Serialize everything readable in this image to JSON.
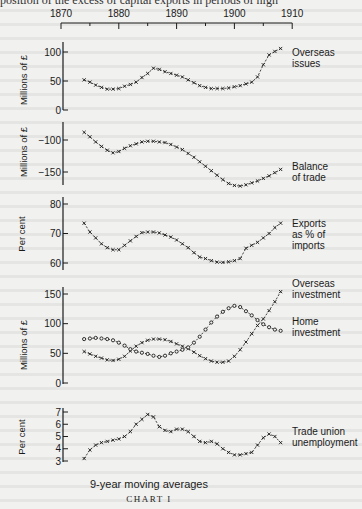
{
  "page": {
    "top_text_fragment": "position of the excess of capital exports in periods of high",
    "subtitle": "9-year moving averages",
    "chart_title": "CHART I"
  },
  "x_axis": {
    "ticks": [
      1870,
      1880,
      1890,
      1900,
      1910
    ],
    "minor_tick_step": 5,
    "position": "top"
  },
  "chart_data": [
    {
      "type": "line",
      "title": "Overseas issues",
      "ylabel": "Millions of £",
      "yticks": [
        0,
        50,
        100
      ],
      "ylim": [
        0,
        100
      ],
      "marker": "x",
      "x": [
        1874,
        1875,
        1876,
        1877,
        1878,
        1879,
        1880,
        1881,
        1882,
        1883,
        1884,
        1885,
        1886,
        1887,
        1888,
        1889,
        1890,
        1891,
        1892,
        1893,
        1894,
        1895,
        1896,
        1897,
        1898,
        1899,
        1900,
        1901,
        1902,
        1903,
        1904,
        1905,
        1906,
        1907,
        1908
      ],
      "series": [
        {
          "name": "Overseas issues",
          "values": [
            52,
            48,
            43,
            39,
            36,
            36,
            37,
            41,
            44,
            48,
            56,
            63,
            72,
            70,
            66,
            63,
            60,
            57,
            52,
            47,
            42,
            39,
            37,
            37,
            37,
            38,
            40,
            42,
            45,
            48,
            57,
            78,
            95,
            101,
            106
          ]
        }
      ]
    },
    {
      "type": "line",
      "title": "Balance of trade",
      "ylabel": "Millions of £",
      "yticks": [
        -100,
        -150
      ],
      "ylim": [
        -180,
        -80
      ],
      "marker": "x",
      "x": [
        1874,
        1875,
        1876,
        1877,
        1878,
        1879,
        1880,
        1881,
        1882,
        1883,
        1884,
        1885,
        1886,
        1887,
        1888,
        1889,
        1890,
        1891,
        1892,
        1893,
        1894,
        1895,
        1896,
        1897,
        1898,
        1899,
        1900,
        1901,
        1902,
        1903,
        1904,
        1905,
        1906,
        1907,
        1908
      ],
      "series": [
        {
          "name": "Balance of trade",
          "values": [
            -88,
            -95,
            -103,
            -110,
            -116,
            -120,
            -118,
            -113,
            -109,
            -106,
            -103,
            -102,
            -102,
            -103,
            -104,
            -107,
            -111,
            -115,
            -121,
            -127,
            -134,
            -141,
            -148,
            -155,
            -162,
            -168,
            -171,
            -172,
            -170,
            -167,
            -164,
            -160,
            -156,
            -151,
            -146
          ]
        }
      ]
    },
    {
      "type": "line",
      "title": "Exports as % of imports",
      "ylabel": "Per cent",
      "yticks": [
        60,
        70,
        80
      ],
      "ylim": [
        58,
        80
      ],
      "marker": "x",
      "x": [
        1874,
        1875,
        1876,
        1877,
        1878,
        1879,
        1880,
        1881,
        1882,
        1883,
        1884,
        1885,
        1886,
        1887,
        1888,
        1889,
        1890,
        1891,
        1892,
        1893,
        1894,
        1895,
        1896,
        1897,
        1898,
        1899,
        1900,
        1901,
        1902,
        1903,
        1904,
        1905,
        1906,
        1907,
        1908
      ],
      "series": [
        {
          "name": "Exports as % of imports",
          "values": [
            73.5,
            70.5,
            68.5,
            66.5,
            65.2,
            64.5,
            64.5,
            66,
            67.5,
            69,
            70.3,
            70.5,
            70.5,
            70.2,
            69.5,
            68.8,
            67.8,
            66.5,
            65.2,
            63.5,
            62,
            61.5,
            60.8,
            60.3,
            60.2,
            60.4,
            60.8,
            61.5,
            65,
            66,
            67,
            68.5,
            70,
            72,
            73.5
          ]
        }
      ]
    },
    {
      "type": "line",
      "title": "Overseas investment vs Home investment",
      "ylabel": "Millions of £",
      "yticks": [
        0,
        50,
        100,
        150
      ],
      "ylim": [
        0,
        155
      ],
      "x": [
        1874,
        1875,
        1876,
        1877,
        1878,
        1879,
        1880,
        1881,
        1882,
        1883,
        1884,
        1885,
        1886,
        1887,
        1888,
        1889,
        1890,
        1891,
        1892,
        1893,
        1894,
        1895,
        1896,
        1897,
        1898,
        1899,
        1900,
        1901,
        1902,
        1903,
        1904,
        1905,
        1906,
        1907,
        1908
      ],
      "series": [
        {
          "name": "Overseas investment",
          "marker": "x",
          "values": [
            53,
            49,
            45,
            42,
            39,
            38,
            40,
            45,
            54,
            62,
            68,
            72,
            74,
            74,
            73,
            70,
            66,
            62,
            58,
            52,
            46,
            41,
            37,
            35,
            35,
            37,
            45,
            56,
            69,
            83,
            97,
            108,
            122,
            137,
            154
          ]
        },
        {
          "name": "Home investment",
          "marker": "o",
          "values": [
            74,
            75,
            76,
            75,
            74,
            72,
            68,
            63,
            57,
            53,
            51,
            49,
            46,
            44,
            46,
            50,
            53,
            56,
            60,
            68,
            78,
            90,
            102,
            112,
            120,
            126,
            130,
            128,
            121,
            114,
            106,
            99,
            94,
            90,
            88
          ]
        }
      ]
    },
    {
      "type": "line",
      "title": "Trade union unemployment",
      "ylabel": "Per cent",
      "yticks": [
        3,
        4,
        5,
        6,
        7
      ],
      "ylim": [
        3,
        7
      ],
      "marker": "x",
      "x": [
        1874,
        1875,
        1876,
        1877,
        1878,
        1879,
        1880,
        1881,
        1882,
        1883,
        1884,
        1885,
        1886,
        1887,
        1888,
        1889,
        1890,
        1891,
        1892,
        1893,
        1894,
        1895,
        1896,
        1897,
        1898,
        1899,
        1900,
        1901,
        1902,
        1903,
        1904,
        1905,
        1906,
        1907,
        1908
      ],
      "series": [
        {
          "name": "Trade union unemployment",
          "values": [
            3.2,
            3.9,
            4.3,
            4.5,
            4.6,
            4.7,
            4.8,
            5.0,
            5.4,
            6.0,
            6.4,
            6.8,
            6.6,
            5.8,
            5.5,
            5.4,
            5.6,
            5.6,
            5.4,
            5.0,
            4.6,
            4.5,
            4.6,
            4.4,
            4.0,
            3.7,
            3.5,
            3.5,
            3.6,
            3.7,
            4.3,
            4.9,
            5.2,
            5.0,
            4.5
          ]
        }
      ]
    }
  ],
  "panels": [
    {
      "ylabel": "Millions of £",
      "label_lines": [
        "Overseas",
        "issues"
      ]
    },
    {
      "ylabel": "Millions of £",
      "label_lines": [
        "Balance",
        "of trade"
      ]
    },
    {
      "ylabel": "Per cent",
      "label_lines": [
        "Exports",
        "as % of",
        "imports"
      ]
    },
    {
      "ylabel": "Millions of £",
      "label_lines": [
        "Overseas",
        "investment",
        "Home",
        "investment"
      ]
    },
    {
      "ylabel": "Per cent",
      "label_lines": [
        "Trade union",
        "unemployment"
      ]
    }
  ],
  "colors": {
    "ink": "#1b1b1b",
    "paper": "#f1f1ef"
  }
}
